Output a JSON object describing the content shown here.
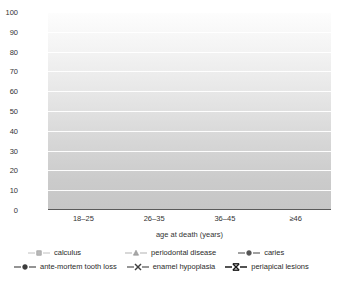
{
  "chart_data": {
    "type": "line",
    "title": "",
    "xlabel": "age at death (years)",
    "ylabel": "% prevalence",
    "categories": [
      "18–25",
      "26–35",
      "36–45",
      "≥46"
    ],
    "ylim": [
      0,
      100
    ],
    "yticks": [
      0,
      10,
      20,
      30,
      40,
      50,
      60,
      70,
      80,
      90,
      100
    ],
    "grid": "horizontal",
    "legend_position": "bottom",
    "series": [
      {
        "name": "calculus",
        "marker": "square",
        "color": "#b9b9b9",
        "values": [
          68,
          88,
          88.5,
          72.5
        ]
      },
      {
        "name": "periodontal disease",
        "marker": "triangle",
        "color": "#a8a8a8",
        "values": [
          15.5,
          42,
          51.5,
          23
        ]
      },
      {
        "name": "caries",
        "marker": "circle",
        "color": "#555555",
        "values": [
          15.5,
          17.5,
          16.5,
          67
        ]
      },
      {
        "name": "ante-mortem tooth loss",
        "marker": "circle",
        "color": "#3c3c3c",
        "values": [
          2.5,
          18,
          20,
          21
        ]
      },
      {
        "name": "enamel hypoplasia",
        "marker": "x",
        "color": "#404040",
        "values": [
          15.5,
          17.5,
          16.5,
          11
        ]
      },
      {
        "name": "periapical lesions",
        "marker": "x-bar",
        "color": "#1a1a1a",
        "values": [
          0.5,
          0.5,
          1,
          1
        ]
      }
    ]
  },
  "axis": {
    "ylabel": "% prevalence",
    "xlabel": "age at death (years)",
    "yticks": [
      "100",
      "90",
      "80",
      "70",
      "60",
      "50",
      "40",
      "30",
      "20",
      "10",
      "0"
    ],
    "xticks": [
      "18–25",
      "26–35",
      "36–45",
      "≥46"
    ]
  },
  "legend": {
    "row1": [
      {
        "label": "calculus",
        "marker": "square",
        "color": "#b9b9b9"
      },
      {
        "label": "periodontal disease",
        "marker": "triangle",
        "color": "#a8a8a8"
      },
      {
        "label": "caries",
        "marker": "circle",
        "color": "#555555"
      }
    ],
    "row2": [
      {
        "label": "ante-mortem tooth loss",
        "marker": "circle",
        "color": "#3c3c3c"
      },
      {
        "label": "enamel hypoplasia",
        "marker": "x",
        "color": "#404040"
      },
      {
        "label": "periapical lesions",
        "marker": "x-bar",
        "color": "#1a1a1a"
      }
    ]
  }
}
